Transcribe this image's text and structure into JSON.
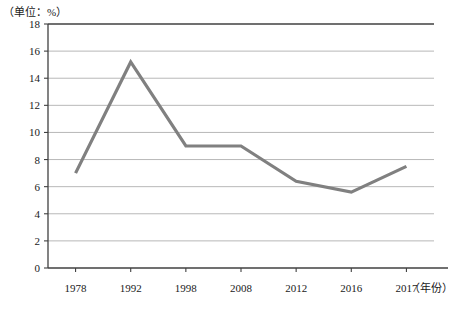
{
  "chart_data": {
    "type": "line",
    "title": "",
    "subtitle": "",
    "unit_label": "（单位：%）",
    "xlabel": "（年份）",
    "ylabel": "",
    "categories": [
      "1978",
      "1992",
      "1998",
      "2008",
      "2012",
      "2016",
      "2017"
    ],
    "values": [
      7.0,
      15.2,
      9.0,
      9.0,
      6.4,
      5.6,
      7.5
    ],
    "series": [
      {
        "name": "",
        "values": [
          7.0,
          15.2,
          9.0,
          9.0,
          6.4,
          5.6,
          7.5
        ]
      }
    ],
    "ylim": [
      0,
      18
    ],
    "ytick_step": 2,
    "ytick_labels": [
      "0",
      "2",
      "4",
      "6",
      "8",
      "10",
      "12",
      "14",
      "16",
      "18"
    ],
    "grid": true,
    "legend": "none",
    "line_color": "#808080",
    "grid_color": "#b0b0b0",
    "axis_color": "#404040",
    "markers": false
  }
}
